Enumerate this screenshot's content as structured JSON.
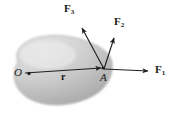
{
  "figure": {
    "kind": "rigid-body-force-diagram",
    "background_color": "#ffffff",
    "body": {
      "name": "rigid-body-blob",
      "fill_light": "#e2e2e2",
      "fill_mid": "#c9c9c9",
      "fill_dark": "#a8a8a8",
      "outline_color": "#9a9a9a"
    },
    "points": [
      {
        "id": "O",
        "label": "O",
        "x": 22,
        "y": 73,
        "marker": true
      },
      {
        "id": "A",
        "label": "A",
        "x": 104,
        "y": 69,
        "marker": true
      }
    ],
    "position_vector": {
      "label": "r",
      "from": "O",
      "to": "A",
      "label_x": 62,
      "label_y": 76
    },
    "forces": [
      {
        "id": "F1",
        "label": "F",
        "subscript": "1",
        "from_x": 104,
        "from_y": 69,
        "tip_x": 152,
        "tip_y": 71,
        "label_x": 156,
        "label_y": 67
      },
      {
        "id": "F2",
        "label": "F",
        "subscript": "2",
        "from_x": 104,
        "from_y": 69,
        "tip_x": 113,
        "tip_y": 34,
        "label_x": 116,
        "label_y": 19
      },
      {
        "id": "F3",
        "label": "F",
        "subscript": "3",
        "from_x": 104,
        "from_y": 69,
        "tip_x": 80,
        "tip_y": 24,
        "label_x": 66,
        "label_y": 5
      }
    ],
    "stroke_color": "#1f1f1f"
  }
}
